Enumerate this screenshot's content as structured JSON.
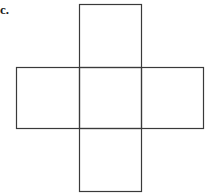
{
  "label": "c.",
  "figure": {
    "type": "cube-net-cross",
    "stroke": "#3a3a3a",
    "squares": [
      {
        "name": "top",
        "x": 79,
        "y": 4,
        "w": 62,
        "h": 63
      },
      {
        "name": "left",
        "x": 16,
        "y": 67,
        "w": 63,
        "h": 61
      },
      {
        "name": "center",
        "x": 79,
        "y": 67,
        "w": 62,
        "h": 61
      },
      {
        "name": "right",
        "x": 141,
        "y": 67,
        "w": 62,
        "h": 61
      },
      {
        "name": "bottom",
        "x": 79,
        "y": 128,
        "w": 62,
        "h": 63
      }
    ]
  }
}
